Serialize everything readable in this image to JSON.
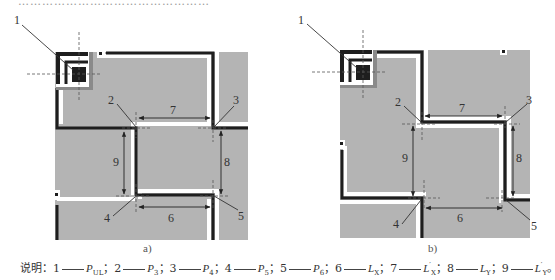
{
  "figure": {
    "top_text_fragment": "…………………………………………",
    "panels": [
      {
        "id": "a",
        "label": "a)",
        "callouts": [
          "1",
          "2",
          "3",
          "4",
          "5",
          "6",
          "7",
          "8",
          "9"
        ]
      },
      {
        "id": "b",
        "label": "b)",
        "callouts": [
          "1",
          "2",
          "3",
          "4",
          "5",
          "6",
          "7",
          "8",
          "9"
        ]
      }
    ],
    "colors": {
      "fill": "#b4b4b4",
      "outline": "#1e1e1e",
      "leader": "#333333",
      "dashed": "#555555"
    }
  },
  "caption": {
    "prefix": "说明：",
    "items": [
      {
        "num": "1",
        "sym": "P",
        "sub": "UL",
        "prime": "",
        "sep": "；"
      },
      {
        "num": "2",
        "sym": "P",
        "sub": "3",
        "prime": "",
        "sep": "；"
      },
      {
        "num": "3",
        "sym": "P",
        "sub": "4",
        "prime": "",
        "sep": "；"
      },
      {
        "num": "4",
        "sym": "P",
        "sub": "5",
        "prime": "",
        "sep": "；"
      },
      {
        "num": "5",
        "sym": "P",
        "sub": "6",
        "prime": "",
        "sep": "；"
      },
      {
        "num": "6",
        "sym": "L",
        "sub": "X",
        "prime": "",
        "sep": "；"
      },
      {
        "num": "7",
        "sym": "L",
        "sub": "X",
        "prime": "′",
        "sep": "；"
      },
      {
        "num": "8",
        "sym": "L",
        "sub": "Y",
        "prime": "",
        "sep": "；"
      },
      {
        "num": "9",
        "sym": "L",
        "sub": "Y",
        "prime": "′",
        "sep": "。"
      }
    ]
  }
}
